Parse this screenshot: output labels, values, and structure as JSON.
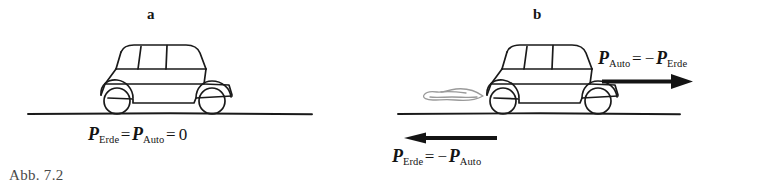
{
  "figure": {
    "caption": "Abb. 7.2",
    "background_color": "#ffffff",
    "ink_color": "#1a1a1a",
    "panels": [
      {
        "key": "a",
        "label": "a",
        "description": "car at rest on ground",
        "has_exhaust": false,
        "arrows": [],
        "equations": [
          {
            "id": "p-erde-equals-p-auto-equals-zero",
            "parts": [
              {
                "type": "symbol",
                "text": "P"
              },
              {
                "type": "subscript",
                "text": "Erde"
              },
              {
                "type": "operator",
                "text": "="
              },
              {
                "type": "symbol",
                "text": "P"
              },
              {
                "type": "subscript",
                "text": "Auto"
              },
              {
                "type": "operator",
                "text": "="
              },
              {
                "type": "operator",
                "text": "0"
              }
            ],
            "plain": "P_Erde = P_Auto = 0"
          }
        ]
      },
      {
        "key": "b",
        "label": "b",
        "description": "car accelerating with exhaust, opposite momentum arrows",
        "has_exhaust": true,
        "arrows": [
          {
            "id": "arrow-auto-right",
            "direction": "right"
          },
          {
            "id": "arrow-erde-left",
            "direction": "left"
          }
        ],
        "equations": [
          {
            "id": "p-auto-equals-minus-p-erde",
            "parts": [
              {
                "type": "symbol",
                "text": "P"
              },
              {
                "type": "subscript",
                "text": "Auto"
              },
              {
                "type": "operator",
                "text": "="
              },
              {
                "type": "operator",
                "text": "−"
              },
              {
                "type": "symbol",
                "text": "P"
              },
              {
                "type": "subscript",
                "text": "Erde"
              }
            ],
            "plain": "P_Auto = − P_Erde"
          },
          {
            "id": "p-erde-equals-minus-p-auto",
            "parts": [
              {
                "type": "symbol",
                "text": "P"
              },
              {
                "type": "subscript",
                "text": "Erde"
              },
              {
                "type": "operator",
                "text": "="
              },
              {
                "type": "operator",
                "text": "−"
              },
              {
                "type": "symbol",
                "text": "P"
              },
              {
                "type": "subscript",
                "text": "Auto"
              }
            ],
            "plain": "P_Erde = − P_Auto"
          }
        ]
      }
    ],
    "symbols": {
      "momentum": "P",
      "subscript_earth": "Erde",
      "subscript_car": "Auto",
      "equals": "=",
      "minus": "−",
      "zero": "0"
    }
  }
}
